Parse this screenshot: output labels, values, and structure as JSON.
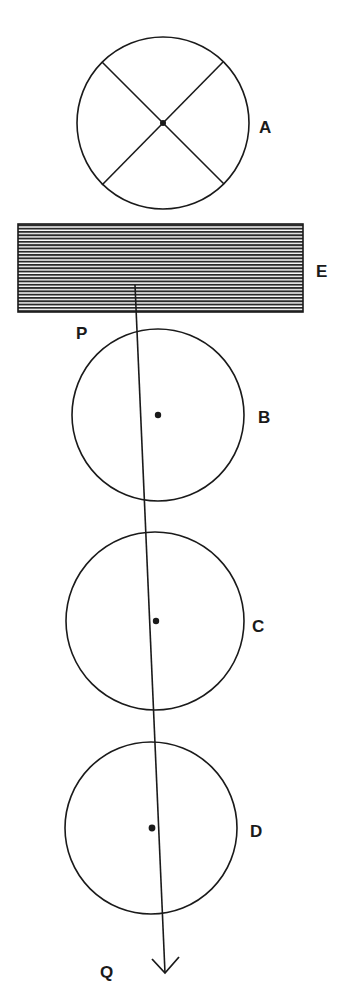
{
  "diagram": {
    "colors": {
      "ink": "#1a1a1a",
      "background": "#ffffff"
    },
    "labels": {
      "A": "A",
      "E": "E",
      "P": "P",
      "B": "B",
      "C": "C",
      "D": "D",
      "Q": "Q"
    },
    "elements": [
      {
        "id": "A",
        "type": "circle-with-cross",
        "center": [
          163,
          123
        ],
        "radius": 86
      },
      {
        "id": "E",
        "type": "hatched-rectangle",
        "x": 18,
        "y": 224,
        "width": 285,
        "height": 88
      },
      {
        "id": "B",
        "type": "circle-with-dot",
        "center": [
          158,
          415
        ],
        "radius": 86
      },
      {
        "id": "C",
        "type": "circle-with-dot",
        "center": [
          155,
          621
        ],
        "radius": 89
      },
      {
        "id": "D",
        "type": "circle-with-dot",
        "center": [
          151,
          828
        ],
        "radius": 86
      },
      {
        "id": "PQ",
        "type": "arrow-line",
        "from": [
          135,
          285
        ],
        "to": [
          165,
          973
        ]
      }
    ]
  }
}
